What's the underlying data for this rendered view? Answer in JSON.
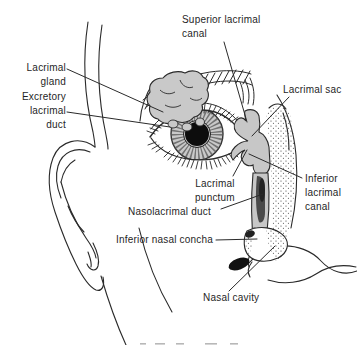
{
  "figure": {
    "type": "anatomical-diagram"
  },
  "labels": {
    "superior_lacrimal_canal": "Superior lacrimal\ncanal",
    "lacrimal_gland": "Lacrimal\ngland",
    "excretory_lacrimal_duct": "Excretory\nlacrimal\nduct",
    "lacrimal_sac": "Lacrimal sac",
    "lacrimal_punctum": "Lacrimal\npunctum",
    "inferior_lacrimal_canal": "Inferior\nlacrimal\ncanal",
    "nasolacrimal_duct": "Nasolacrimal duct",
    "inferior_nasal_concha": "Inferior nasal concha",
    "nasal_cavity": "Nasal cavity"
  },
  "colors": {
    "line": "#2a2a2a",
    "soft_tissue_gray": "#c9c9c9",
    "dark_fill": "#1a1a1a",
    "background": "#ffffff"
  }
}
